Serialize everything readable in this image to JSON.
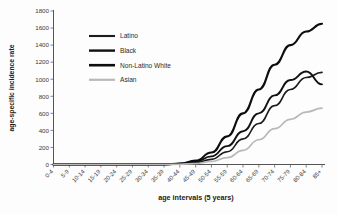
{
  "chart_data": {
    "type": "line",
    "title": "",
    "xlabel": "age intervals (5 years)",
    "ylabel": "age-specific incidence rate",
    "grid": false,
    "legend_position": "upper-left-inside",
    "ylim": [
      0,
      1800
    ],
    "yticks": [
      0,
      200,
      400,
      600,
      800,
      1000,
      1200,
      1400,
      1600,
      1800
    ],
    "categories": [
      "0-4",
      "5-9",
      "10-14",
      "15-19",
      "20-24",
      "25-29",
      "30-34",
      "35-39",
      "40-44",
      "45-49",
      "50-54",
      "55-59",
      "60-64",
      "65-69",
      "70-74",
      "75-79",
      "80-84",
      "85+"
    ],
    "series": [
      {
        "name": "Latino",
        "color": "#1c1c1c",
        "width": 1.6,
        "values": [
          0,
          0,
          0,
          0,
          0,
          0,
          0,
          0,
          5,
          20,
          60,
          150,
          300,
          480,
          690,
          880,
          1020,
          1080
        ]
      },
      {
        "name": "Black",
        "color": "#111111",
        "width": 1.9,
        "values": [
          0,
          0,
          0,
          0,
          0,
          0,
          0,
          0,
          8,
          35,
          95,
          215,
          390,
          600,
          810,
          990,
          1090,
          940
        ]
      },
      {
        "name": "Non-Latino White",
        "color": "#0d0d0d",
        "width": 2.1,
        "values": [
          0,
          0,
          0,
          0,
          0,
          0,
          0,
          0,
          10,
          45,
          140,
          330,
          600,
          880,
          1170,
          1400,
          1560,
          1650
        ]
      },
      {
        "name": "Asian",
        "color": "#b9b9b9",
        "width": 1.7,
        "values": [
          0,
          0,
          0,
          0,
          0,
          0,
          0,
          0,
          3,
          12,
          35,
          80,
          165,
          290,
          420,
          530,
          615,
          660
        ]
      }
    ]
  },
  "legend": {
    "items": [
      {
        "label": "Latino"
      },
      {
        "label": "Black"
      },
      {
        "label": "Non-Latino White"
      },
      {
        "label": "Asian"
      }
    ]
  }
}
